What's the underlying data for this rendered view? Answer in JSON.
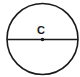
{
  "diagram": {
    "type": "circle-with-diameter",
    "center_label": "C",
    "colors": {
      "stroke": "#1a1a1a",
      "background": "#ffffff"
    },
    "circle": {
      "cx": 42.5,
      "cy": 39,
      "r": 36
    },
    "diameter": {
      "x1": 6.5,
      "y1": 39.5,
      "x2": 78.5,
      "y2": 39.5
    },
    "center_point": {
      "x": 42.5,
      "y": 39.5
    }
  }
}
